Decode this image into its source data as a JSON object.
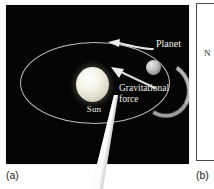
{
  "figure": {
    "panel_a": {
      "caption": "(a)",
      "background_color": "#050505",
      "border_color": "#f2f2f2",
      "labels": {
        "sun": "Sun",
        "planet": "Planet",
        "gravitational_force_line1": "Gravitational",
        "gravitational_force_line2": "force"
      },
      "objects": {
        "sun_color": "#f4f2e6",
        "planet_color": "#c2c2c2",
        "orbit_color": "#c9c9c4",
        "arrow_color": "#e6e6e6",
        "pointer_color": "#f0f0f0"
      },
      "arrows": {
        "velocity_direction": "left",
        "gravitational_direction": "toward-sun"
      }
    },
    "panel_b": {
      "caption": "(b)",
      "background_color": "#ffffff",
      "border_color": "#4a4a4a",
      "visible_text": "N"
    }
  }
}
